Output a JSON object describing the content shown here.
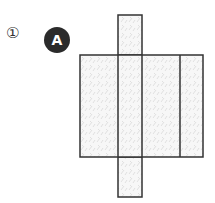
{
  "figure": {
    "item_number": "①",
    "label": "A",
    "colors": {
      "stroke": "#333333",
      "fill": "#f2f2f2",
      "badge": "#2b2b2b"
    }
  }
}
